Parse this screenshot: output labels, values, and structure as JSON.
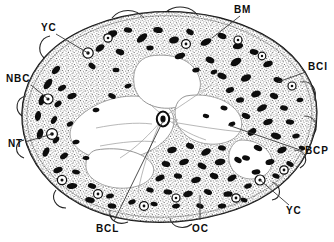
{
  "figure": {
    "kind": "histological-cross-section-line-drawing",
    "width": 334,
    "height": 242,
    "background_color": "#ffffff",
    "ink_color": "#0d0d0d"
  },
  "labels": [
    {
      "id": "bm",
      "text": "BM",
      "x": 234,
      "y": 5,
      "leader": {
        "x1": 240,
        "y1": 16,
        "x2": 212,
        "y2": 38
      }
    },
    {
      "id": "yc-top-left",
      "text": "YC",
      "x": 41,
      "y": 23,
      "leader": {
        "x1": 56,
        "y1": 34,
        "x2": 88,
        "y2": 53
      }
    },
    {
      "id": "bci",
      "text": "BCI",
      "x": 308,
      "y": 62,
      "leader": {
        "x1": 306,
        "y1": 72,
        "x2": 278,
        "y2": 82
      }
    },
    {
      "id": "nbc",
      "text": "NBC",
      "x": 6,
      "y": 74,
      "leader": {
        "x1": 31,
        "y1": 85,
        "x2": 48,
        "y2": 99
      }
    },
    {
      "id": "nt",
      "text": "NT",
      "x": 8,
      "y": 139,
      "leader": {
        "x1": 25,
        "y1": 142,
        "x2": 52,
        "y2": 134
      }
    },
    {
      "id": "bcp",
      "text": "BCP",
      "x": 305,
      "y": 146,
      "leader": {
        "x1": 303,
        "y1": 151,
        "x2": 228,
        "y2": 125
      }
    },
    {
      "id": "yc-bottom-right",
      "text": "YC",
      "x": 286,
      "y": 206,
      "leader": {
        "x1": 289,
        "y1": 205,
        "x2": 260,
        "y2": 180
      }
    },
    {
      "id": "bcl",
      "text": "BCL",
      "x": 96,
      "y": 224,
      "leader": {
        "x1": 114,
        "y1": 221,
        "x2": 163,
        "y2": 121
      }
    },
    {
      "id": "oc",
      "text": "OC",
      "x": 192,
      "y": 224,
      "leader": {
        "x1": 200,
        "y1": 220,
        "x2": 200,
        "y2": 195
      }
    }
  ],
  "legend_keys": {
    "BM": "BM",
    "YC": "YC",
    "BCI": "BCI",
    "NBC": "NBC",
    "NT": "NT",
    "BCP": "BCP",
    "BCL": "BCL",
    "OC": "OC"
  }
}
